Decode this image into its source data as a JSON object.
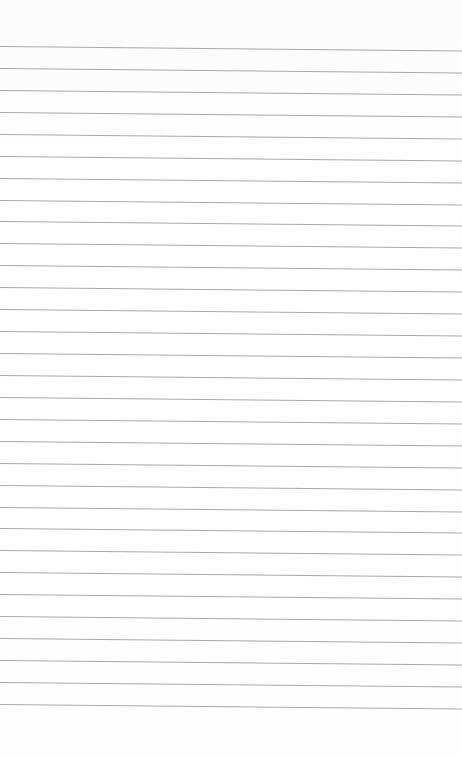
{
  "paper": {
    "type": "lined-paper",
    "line_color": "#a9a9a9",
    "background_color": "#fdfdfd",
    "first_line_y": 46,
    "line_spacing": 21.93,
    "line_count": 31
  }
}
